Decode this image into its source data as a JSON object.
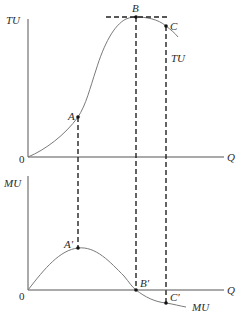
{
  "diagram": {
    "type": "economics-utility",
    "colors": {
      "axis": "#555555",
      "curve": "#7a7a7a",
      "dash": "#222222",
      "point": "#111111",
      "text": "#2a2a2a"
    },
    "top_panel": {
      "y_axis_label": "TU",
      "x_axis_label": "Q",
      "origin_label": "0",
      "curve_label": "TU",
      "points": [
        {
          "label": "A",
          "x": 78,
          "y": 117
        },
        {
          "label": "B",
          "x": 136,
          "y": 17
        },
        {
          "label": "C",
          "x": 166,
          "y": 26
        }
      ]
    },
    "bottom_panel": {
      "y_axis_label": "MU",
      "x_axis_label": "Q",
      "origin_label": "0",
      "curve_label": "MU",
      "points": [
        {
          "label": "A′",
          "x": 78,
          "y": 248
        },
        {
          "label": "B′",
          "x": 136,
          "y": 290
        },
        {
          "label": "C′",
          "x": 166,
          "y": 303
        }
      ]
    }
  }
}
